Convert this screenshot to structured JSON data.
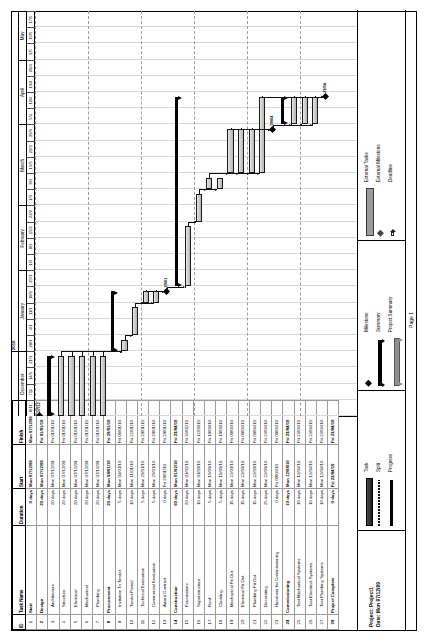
{
  "document": {
    "project_label": "Project: Project1",
    "date_label": "Date: Mon 07/12/09",
    "page_label": "Page 1"
  },
  "table": {
    "columns": [
      "ID",
      "Task Name",
      "Duration",
      "Start",
      "Finish"
    ],
    "rows": [
      {
        "id": "1",
        "name": "Start",
        "duration": "0 days",
        "start": "Mon 07/12/09",
        "finish": "Mon 07/12/09",
        "level": 0
      },
      {
        "id": "2",
        "name": "Design",
        "duration": "20 days",
        "start": "Mon 07/12/09",
        "finish": "Fri 01/01/10",
        "level": 0
      },
      {
        "id": "3",
        "name": "Architecture",
        "duration": "20 days",
        "start": "Mon 07/12/09",
        "finish": "Fri 01/01/10",
        "level": 1
      },
      {
        "id": "4",
        "name": "Structure",
        "duration": "20 days",
        "start": "Mon 07/12/09",
        "finish": "Fri 01/01/10",
        "level": 1
      },
      {
        "id": "5",
        "name": "Electrical",
        "duration": "20 days",
        "start": "Mon 07/12/09",
        "finish": "Fri 01/01/10",
        "level": 1
      },
      {
        "id": "6",
        "name": "Mechanical",
        "duration": "20 days",
        "start": "Mon 07/12/09",
        "finish": "Fri 01/01/10",
        "level": 1
      },
      {
        "id": "7",
        "name": "Plumbing",
        "duration": "20 days",
        "start": "Mon 07/12/09",
        "finish": "Fri 01/01/10",
        "level": 1
      },
      {
        "id": "8",
        "name": "Procurement",
        "duration": "20 days",
        "start": "Mon 04/01/10",
        "finish": "Fri 29/01/10",
        "level": 0
      },
      {
        "id": "9",
        "name": "Invitation To Tender",
        "duration": "5 days",
        "start": "Mon 04/01/10",
        "finish": "Fri 08/01/10",
        "level": 1
      },
      {
        "id": "10",
        "name": "Tender Period",
        "duration": "10 days",
        "start": "Mon 11/01/10",
        "finish": "Fri 22/01/10",
        "level": 1
      },
      {
        "id": "11",
        "name": "Technical Evaluation",
        "duration": "5 days",
        "start": "Mon 25/01/10",
        "finish": "Fri 29/01/10",
        "level": 1
      },
      {
        "id": "12",
        "name": "Commercial Evaluation",
        "duration": "5 days",
        "start": "Mon 25/01/10",
        "finish": "Fri 29/01/10",
        "level": 1
      },
      {
        "id": "13",
        "name": "Award Contract",
        "duration": "0 days",
        "start": "Fri 29/01/10",
        "finish": "Fri 29/01/10",
        "level": 1
      },
      {
        "id": "14",
        "name": "Construction",
        "duration": "60 days",
        "start": "Mon 01/02/10",
        "finish": "Fri 23/04/10",
        "level": 0
      },
      {
        "id": "15",
        "name": "Foundations",
        "duration": "20 days",
        "start": "Mon 01/02/10",
        "finish": "Fri 26/02/10",
        "level": 1
      },
      {
        "id": "16",
        "name": "Superstructure",
        "duration": "10 days",
        "start": "Mon 01/03/10",
        "finish": "Fri 12/03/10",
        "level": 1
      },
      {
        "id": "17",
        "name": "Roof",
        "duration": "5 days",
        "start": "Mon 15/03/10",
        "finish": "Fri 19/03/10",
        "level": 1
      },
      {
        "id": "18",
        "name": "Cladding",
        "duration": "5 days",
        "start": "Mon 15/03/10",
        "finish": "Fri 19/03/10",
        "level": 1
      },
      {
        "id": "19",
        "name": "Mechanical Fit Out",
        "duration": "15 days",
        "start": "Mon 22/03/10",
        "finish": "Fri 09/04/10",
        "level": 1
      },
      {
        "id": "20",
        "name": "Electrical Fit Out",
        "duration": "15 days",
        "start": "Mon 22/03/10",
        "finish": "Fri 09/04/10",
        "level": 1
      },
      {
        "id": "21",
        "name": "Plumbing Fit Out",
        "duration": "15 days",
        "start": "Mon 22/03/10",
        "finish": "Fri 09/04/10",
        "level": 1
      },
      {
        "id": "22",
        "name": "Decorating",
        "duration": "25 days",
        "start": "Mon 22/03/10",
        "finish": "Fri 23/04/10",
        "level": 1
      },
      {
        "id": "23",
        "name": "Handover for Commissioning",
        "duration": "0 days",
        "start": "Fri 09/04/10",
        "finish": "Fri 09/04/10",
        "level": 1
      },
      {
        "id": "24",
        "name": "Commissioning",
        "duration": "10 days",
        "start": "Mon 12/04/10",
        "finish": "Fri 23/04/10",
        "level": 0
      },
      {
        "id": "25",
        "name": "Test Mechanical Systems",
        "duration": "10 days",
        "start": "Mon 12/04/10",
        "finish": "Fri 23/04/10",
        "level": 1
      },
      {
        "id": "26",
        "name": "Test Electrical Systems",
        "duration": "10 days",
        "start": "Mon 12/04/10",
        "finish": "Fri 23/04/10",
        "level": 1
      },
      {
        "id": "27",
        "name": "Test Plumbing Systems",
        "duration": "10 days",
        "start": "Mon 12/04/10",
        "finish": "Fri 23/04/10",
        "level": 1
      },
      {
        "id": "28",
        "name": "Project Complete",
        "duration": "0 days",
        "start": "Fri 23/04/10",
        "finish": "Fri 23/04/10",
        "level": 0
      }
    ]
  },
  "timescale": {
    "years": [
      {
        "label": "",
        "span": 4
      },
      {
        "label": "2010",
        "span": 21
      }
    ],
    "months": [
      {
        "label": "December",
        "span": 4
      },
      {
        "label": "January",
        "span": 5
      },
      {
        "label": "February",
        "span": 4
      },
      {
        "label": "March",
        "span": 5
      },
      {
        "label": "April",
        "span": 4
      },
      {
        "label": "May",
        "span": 3
      }
    ],
    "weeks": [
      "8/11",
      "711",
      "14/1",
      "21/1",
      "28/1",
      "4/1",
      "11/1",
      "18/1",
      "25/1",
      "1/2",
      "8/2",
      "15/2",
      "22/2",
      "1/3",
      "8/3",
      "15/3",
      "22/3",
      "29/3",
      "5/4",
      "12/4",
      "19/4",
      "26/4",
      "3/5",
      "10/5",
      "17/5"
    ]
  },
  "chart_data": {
    "type": "bar",
    "xlabel": "Timeline (weeks, Dec 2009 – May 2010)",
    "ylabel": "Task",
    "grid": true,
    "legend_position": "bottom",
    "x_range": [
      "2009-12-07",
      "2010-05-17"
    ],
    "categories": [
      "Start",
      "Design",
      "Architecture",
      "Structure",
      "Electrical",
      "Mechanical",
      "Plumbing",
      "Procurement",
      "Invitation To Tender",
      "Tender Period",
      "Technical Evaluation",
      "Commercial Evaluation",
      "Award Contract",
      "Construction",
      "Foundations",
      "Superstructure",
      "Roof",
      "Cladding",
      "Mechanical Fit Out",
      "Electrical Fit Out",
      "Plumbing Fit Out",
      "Decorating",
      "Handover for Commissioning",
      "Commissioning",
      "Test Mechanical Systems",
      "Test Electrical Systems",
      "Test Plumbing Systems",
      "Project Complete"
    ],
    "bars": [
      {
        "task": "Start",
        "kind": "milestone",
        "start_day": 0,
        "duration_days": 0,
        "label": "07/12"
      },
      {
        "task": "Design",
        "kind": "summary",
        "start_day": 0,
        "duration_days": 26
      },
      {
        "task": "Architecture",
        "kind": "task",
        "start_day": 0,
        "duration_days": 26
      },
      {
        "task": "Structure",
        "kind": "task",
        "start_day": 0,
        "duration_days": 26
      },
      {
        "task": "Electrical",
        "kind": "task",
        "start_day": 0,
        "duration_days": 26
      },
      {
        "task": "Mechanical",
        "kind": "task",
        "start_day": 0,
        "duration_days": 26
      },
      {
        "task": "Plumbing",
        "kind": "task",
        "start_day": 0,
        "duration_days": 26
      },
      {
        "task": "Procurement",
        "kind": "summary",
        "start_day": 28,
        "duration_days": 26
      },
      {
        "task": "Invitation To Tender",
        "kind": "task",
        "start_day": 28,
        "duration_days": 5
      },
      {
        "task": "Tender Period",
        "kind": "task",
        "start_day": 35,
        "duration_days": 12
      },
      {
        "task": "Technical Evaluation",
        "kind": "task",
        "start_day": 49,
        "duration_days": 5
      },
      {
        "task": "Commercial Evaluation",
        "kind": "task",
        "start_day": 49,
        "duration_days": 5
      },
      {
        "task": "Award Contract",
        "kind": "milestone",
        "start_day": 54,
        "duration_days": 0,
        "label": "29/01"
      },
      {
        "task": "Construction",
        "kind": "summary",
        "start_day": 56,
        "duration_days": 82
      },
      {
        "task": "Foundations",
        "kind": "task",
        "start_day": 56,
        "duration_days": 26
      },
      {
        "task": "Superstructure",
        "kind": "task",
        "start_day": 84,
        "duration_days": 12
      },
      {
        "task": "Roof",
        "kind": "task",
        "start_day": 98,
        "duration_days": 5
      },
      {
        "task": "Cladding",
        "kind": "task",
        "start_day": 98,
        "duration_days": 5
      },
      {
        "task": "Mechanical Fit Out",
        "kind": "task",
        "start_day": 105,
        "duration_days": 19
      },
      {
        "task": "Electrical Fit Out",
        "kind": "task",
        "start_day": 105,
        "duration_days": 19
      },
      {
        "task": "Plumbing Fit Out",
        "kind": "task",
        "start_day": 105,
        "duration_days": 19
      },
      {
        "task": "Decorating",
        "kind": "task",
        "start_day": 105,
        "duration_days": 33
      },
      {
        "task": "Handover for Commissioning",
        "kind": "milestone",
        "start_day": 124,
        "duration_days": 0,
        "label": "09/04"
      },
      {
        "task": "Commissioning",
        "kind": "summary",
        "start_day": 126,
        "duration_days": 12
      },
      {
        "task": "Test Mechanical Systems",
        "kind": "task",
        "start_day": 126,
        "duration_days": 12
      },
      {
        "task": "Test Electrical Systems",
        "kind": "task",
        "start_day": 126,
        "duration_days": 12
      },
      {
        "task": "Test Plumbing Systems",
        "kind": "task",
        "start_day": 126,
        "duration_days": 12
      },
      {
        "task": "Project Complete",
        "kind": "milestone",
        "start_day": 138,
        "duration_days": 0,
        "label": "23/04"
      }
    ],
    "milestone_labels": [
      "07/12",
      "29/01",
      "09/04",
      "23/04"
    ]
  },
  "legend": {
    "column1": [
      {
        "label": "Task",
        "symbol": "task-bar"
      },
      {
        "label": "Split",
        "symbol": "split-bar"
      },
      {
        "label": "Progress",
        "symbol": "progress-bar"
      }
    ],
    "column2": [
      {
        "label": "Milestone",
        "symbol": "milestone-diamond"
      },
      {
        "label": "Summary",
        "symbol": "summary-bar"
      },
      {
        "label": "Project Summary",
        "symbol": "project-summary-bar"
      }
    ],
    "column3": [
      {
        "label": "External Tasks",
        "symbol": "external-task-bar"
      },
      {
        "label": "External Milestone",
        "symbol": "external-milestone-diamond"
      },
      {
        "label": "Deadline",
        "symbol": "deadline-arrow"
      }
    ]
  }
}
